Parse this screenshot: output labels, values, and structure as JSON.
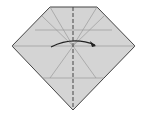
{
  "diagram": {
    "type": "origami-fold-step",
    "paper_color": "#d4d4d4",
    "edge_color": "#444444",
    "crease_color": "#9a9a9a",
    "dashed_line_color": "#444444",
    "arrow_color": "#222222",
    "shape": "pentagon (gem/diamond outline)",
    "instruction": "valley fold along vertical center line, fold left half over to the right",
    "icons": [
      "fold-arrow-icon",
      "valley-fold-line"
    ]
  }
}
